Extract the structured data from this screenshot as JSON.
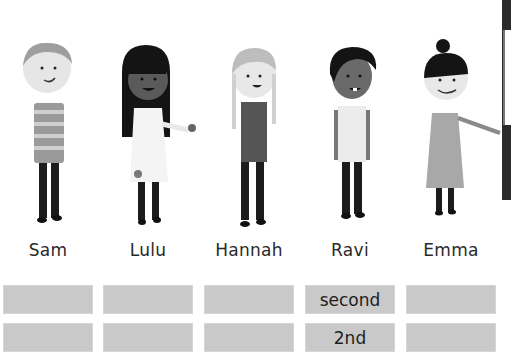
{
  "children": [
    {
      "name": "Sam",
      "ordinal_word": "",
      "ordinal_number": ""
    },
    {
      "name": "Lulu",
      "ordinal_word": "",
      "ordinal_number": ""
    },
    {
      "name": "Hannah",
      "ordinal_word": "",
      "ordinal_number": ""
    },
    {
      "name": "Ravi",
      "ordinal_word": "second",
      "ordinal_number": "2nd"
    },
    {
      "name": "Emma",
      "ordinal_word": "",
      "ordinal_number": ""
    }
  ],
  "colors": {
    "box_fill": "#c9c9c9",
    "text": "#2a2a2a",
    "background": "#ffffff"
  }
}
